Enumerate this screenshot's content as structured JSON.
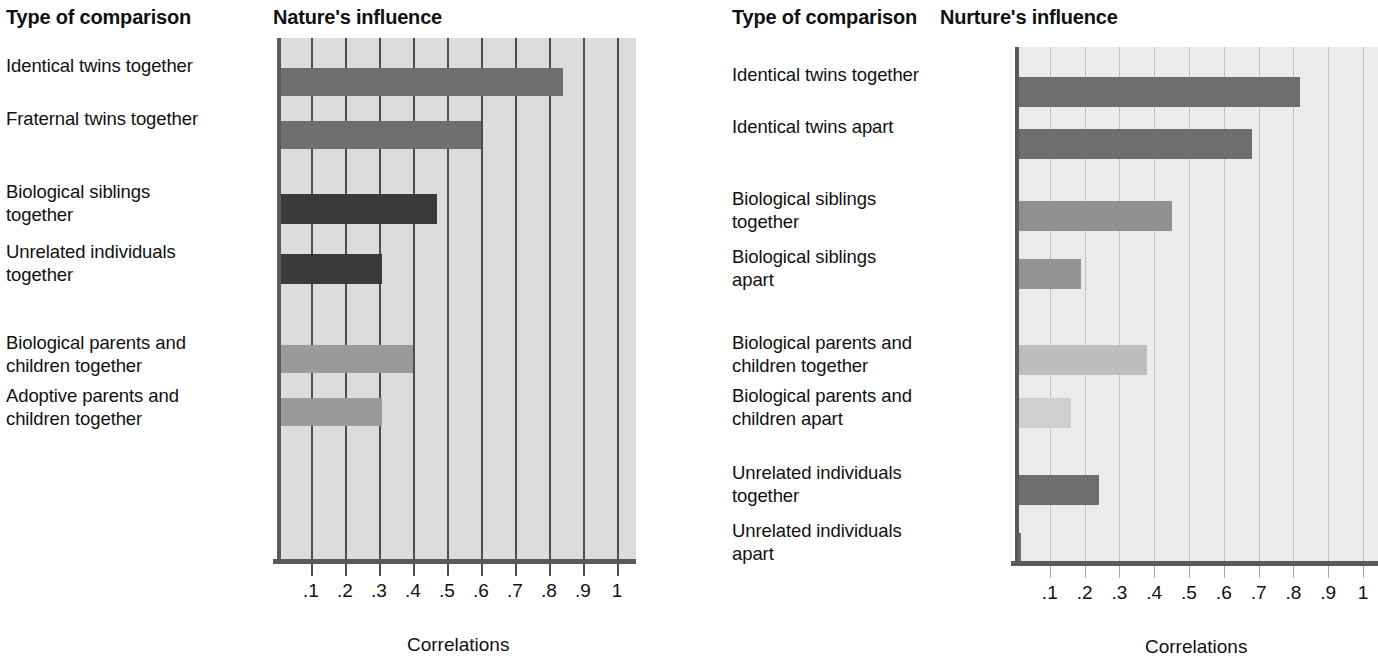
{
  "charts": [
    {
      "id": "nature",
      "column_header": "Type of comparison",
      "title": "Nature's influence",
      "axis_title": "Correlations",
      "tick_labels": [
        ".1",
        ".2",
        ".3",
        ".4",
        ".5",
        ".6",
        ".7",
        ".8",
        ".9",
        "1"
      ],
      "rows": [
        {
          "label": "Identical twins together",
          "value": 0.84,
          "color": "#6e6e6e",
          "top": 68,
          "height": 28
        },
        {
          "label": "Fraternal twins together",
          "value": 0.6,
          "color": "#6e6e6e",
          "top": 121,
          "height": 28
        },
        {
          "label": "Biological siblings\ntogether",
          "value": 0.47,
          "color": "#3a3a3a",
          "top": 194,
          "height": 30
        },
        {
          "label": "Unrelated individuals\ntogether",
          "value": 0.31,
          "color": "#3a3a3a",
          "top": 254,
          "height": 30
        },
        {
          "label": "Biological parents and\nchildren together",
          "value": 0.4,
          "color": "#9a9a9a",
          "top": 345,
          "height": 28
        },
        {
          "label": "Adoptive parents and\nchildren together",
          "value": 0.31,
          "color": "#9a9a9a",
          "top": 398,
          "height": 28
        }
      ]
    },
    {
      "id": "nurture",
      "column_header": "Type of comparison",
      "title": "Nurture's influence",
      "axis_title": "Correlations",
      "tick_labels": [
        ".1",
        ".2",
        ".3",
        ".4",
        ".5",
        ".6",
        ".7",
        ".8",
        ".9",
        "1"
      ],
      "rows": [
        {
          "label": "Identical twins together",
          "value": 0.82,
          "color": "#6e6e6e",
          "top": 77,
          "height": 30
        },
        {
          "label": "Identical twins apart",
          "value": 0.68,
          "color": "#6e6e6e",
          "top": 129,
          "height": 30
        },
        {
          "label": "Biological siblings\ntogether",
          "value": 0.45,
          "color": "#8f8f8f",
          "top": 201,
          "height": 30
        },
        {
          "label": "Biological siblings\napart",
          "value": 0.19,
          "color": "#949494",
          "top": 259,
          "height": 30
        },
        {
          "label": "Biological parents and\nchildren together",
          "value": 0.38,
          "color": "#bdbdbd",
          "top": 345,
          "height": 30
        },
        {
          "label": "Biological parents and\nchildren apart",
          "value": 0.16,
          "color": "#cfcfcf",
          "top": 398,
          "height": 30
        },
        {
          "label": "Unrelated individuals\ntogether",
          "value": 0.24,
          "color": "#6e6e6e",
          "top": 475,
          "height": 30
        },
        {
          "label": "Unrelated individuals\napart",
          "value": 0.01,
          "color": "#6e6e6e",
          "top": 533,
          "height": 30
        }
      ]
    }
  ],
  "chart_data": [
    {
      "type": "bar",
      "orientation": "horizontal",
      "title": "Nature's influence",
      "xlabel": "Correlations",
      "ylabel": "Type of comparison",
      "xlim": [
        0,
        1.05
      ],
      "xticks": [
        0.1,
        0.2,
        0.3,
        0.4,
        0.5,
        0.6,
        0.7,
        0.8,
        0.9,
        1.0
      ],
      "xticklabels": [
        ".1",
        ".2",
        ".3",
        ".4",
        ".5",
        ".6",
        ".7",
        ".8",
        ".9",
        "1"
      ],
      "grid": true,
      "legend": "none",
      "categories": [
        "Identical twins together",
        "Fraternal twins together",
        "Biological siblings together",
        "Unrelated individuals together",
        "Biological parents and children together",
        "Adoptive parents and children together"
      ],
      "values": [
        0.84,
        0.6,
        0.47,
        0.31,
        0.4,
        0.31
      ],
      "bar_colors": [
        "#6e6e6e",
        "#6e6e6e",
        "#3a3a3a",
        "#3a3a3a",
        "#9a9a9a",
        "#9a9a9a"
      ]
    },
    {
      "type": "bar",
      "orientation": "horizontal",
      "title": "Nurture's influence",
      "xlabel": "Correlations",
      "ylabel": "Type of comparison",
      "xlim": [
        0,
        1.05
      ],
      "xticks": [
        0.1,
        0.2,
        0.3,
        0.4,
        0.5,
        0.6,
        0.7,
        0.8,
        0.9,
        1.0
      ],
      "xticklabels": [
        ".1",
        ".2",
        ".3",
        ".4",
        ".5",
        ".6",
        ".7",
        ".8",
        ".9",
        "1"
      ],
      "grid": true,
      "legend": "none",
      "categories": [
        "Identical twins together",
        "Identical twins apart",
        "Biological siblings together",
        "Biological siblings apart",
        "Biological parents and children together",
        "Biological parents and children apart",
        "Unrelated individuals together",
        "Unrelated individuals apart"
      ],
      "values": [
        0.82,
        0.68,
        0.45,
        0.19,
        0.38,
        0.16,
        0.24,
        0.01
      ],
      "bar_colors": [
        "#6e6e6e",
        "#6e6e6e",
        "#8f8f8f",
        "#949494",
        "#bdbdbd",
        "#cfcfcf",
        "#6e6e6e",
        "#6e6e6e"
      ]
    }
  ]
}
